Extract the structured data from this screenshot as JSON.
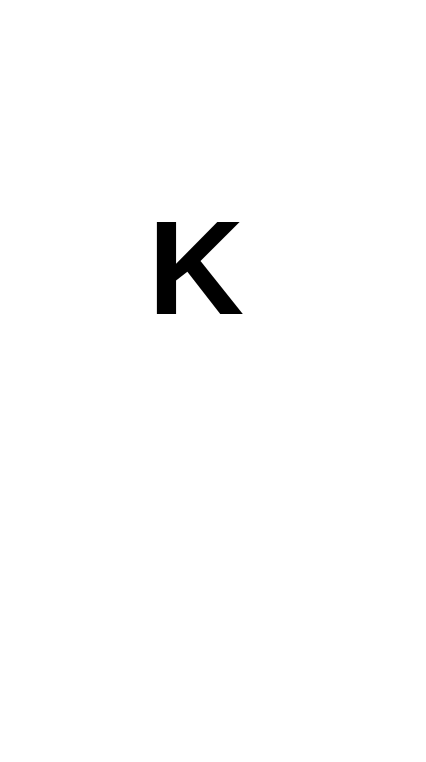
{
  "splash": {
    "logo_text": "K",
    "background_color": "#ffffff",
    "logo_color": "#000000"
  }
}
